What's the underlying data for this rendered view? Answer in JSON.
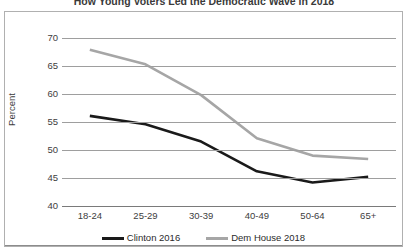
{
  "chart_data": {
    "type": "line",
    "title": "How Young Voters Led the Democratic Wave in 2018",
    "xlabel": "",
    "ylabel": "Percent",
    "categories": [
      "18-24",
      "25-29",
      "30-39",
      "40-49",
      "50-64",
      "65+"
    ],
    "series": [
      {
        "name": "Clinton 2016",
        "color": "#1a1a1a",
        "values": [
          56.1,
          54.6,
          51.5,
          46.2,
          44.2,
          45.2
        ]
      },
      {
        "name": "Dem House 2018",
        "color": "#a6a6a6",
        "values": [
          67.9,
          65.3,
          59.8,
          52.1,
          49.0,
          48.4
        ]
      }
    ],
    "ylim": [
      40,
      70
    ],
    "yticks": [
      70,
      65,
      60,
      55,
      50,
      45,
      40
    ],
    "grid": true,
    "legend_position": "bottom"
  },
  "legend": {
    "entries": [
      {
        "label": "Clinton 2016",
        "color": "#1a1a1a"
      },
      {
        "label": "Dem House 2018",
        "color": "#a6a6a6"
      }
    ]
  }
}
